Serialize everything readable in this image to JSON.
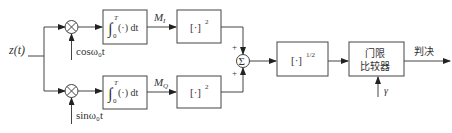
{
  "diagram": {
    "input_label": "z(t)",
    "top_branch": {
      "mixer_symbol": "⊗",
      "carrier_label": "cosω₀t",
      "integrator": {
        "int": "∫",
        "upper": "T",
        "lower": "0",
        "body": "(·) dt"
      },
      "output_label": "M",
      "output_sub": "I",
      "square_box": {
        "base": "[·]",
        "exp": "2"
      }
    },
    "bottom_branch": {
      "mixer_symbol": "⊗",
      "carrier_label": "sinω₀t",
      "integrator": {
        "int": "∫",
        "upper": "T",
        "lower": "0",
        "body": "(·) dt"
      },
      "output_label": "M",
      "output_sub": "Q",
      "square_box": {
        "base": "[·]",
        "exp": "2"
      }
    },
    "summer": {
      "symbol": "Σ",
      "plus_top": "+",
      "plus_bottom": "+"
    },
    "sqrt_box": {
      "base": "[·]",
      "exp": "1/2"
    },
    "comparator": {
      "line1": "门限",
      "line2": "比较器",
      "threshold_label": "γ"
    },
    "output_label": "判决"
  }
}
